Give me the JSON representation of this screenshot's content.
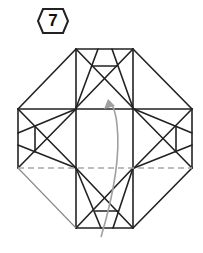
{
  "step": {
    "number": "7"
  },
  "colors": {
    "line": "#222222",
    "back_line": "#888888",
    "dashed": "#a8a8a8",
    "arrow": "#a0a0a0"
  }
}
